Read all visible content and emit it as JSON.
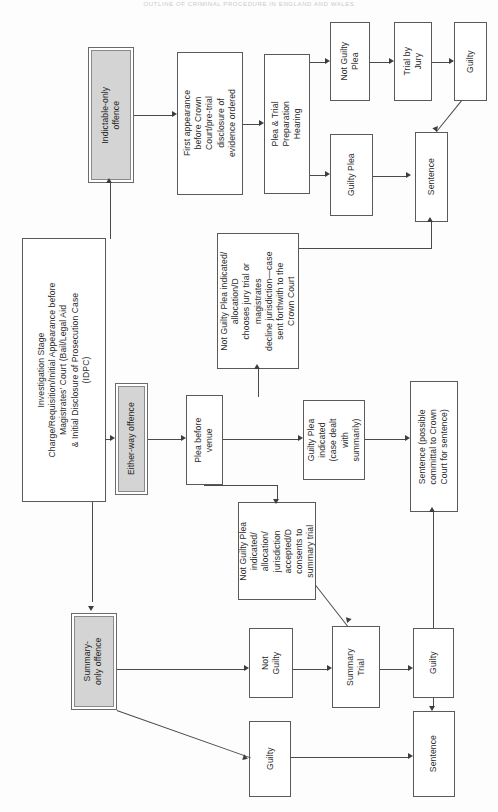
{
  "header": {
    "running_title": "OUTLINE OF CRIMINAL PROCEDURE IN ENGLAND AND WALES"
  },
  "nodes": {
    "investigation": "Investigation Stage\nCharge/Requisition/Initial Appearance before\nMagistrates' Court (Bail/Legal Aid\n& Initial Disclosure of Prosecution Case\n(IDPC)",
    "indictable_only": "Indictable-only\noffence",
    "first_appearance": "First appearance\nbefore Crown\nCourt/pre-trial\ndisclosure of\nevidence ordered",
    "ptph": "Plea & Trial\nPreparation\nHearing",
    "not_guilty_plea": "Not Guilty\nPlea",
    "trial_by_jury": "Trial by\nJury",
    "guilty_crown": "Guilty",
    "guilty_plea_crown": "Guilty Plea",
    "sentence_crown": "Sentence",
    "either_way": "Either-way offence",
    "plea_before_venue": "Plea before\nvenue",
    "ng_allocation_crown": "Not Guilty Plea indicated/\nallocation/D\nchooses jury trial or\nmagistrates\ndecline jurisdiction—case\nsent forthwith to the\nCrown Court",
    "guilty_plea_summary": "Guilty Plea\nindicated\n(case dealt\nwith\nsummarily)",
    "sentence_committal": "Sentence (possible\ncommittal to Crown\nCourt for sentence)",
    "ng_allocation_summary": "Not Guilty Plea\nindicated/\nallocation/\njurisdiction\naccepted/D\nconsents to\nsummary trial",
    "summary_only": "Summary-\nonly offence",
    "not_guilty_mags": "Not\nGuilty",
    "summary_trial": "Summary\nTrial",
    "guilty_mags": "Guilty",
    "guilty_plea_mags": "Guilty",
    "sentence_mags": "Sentence"
  },
  "colors": {
    "category_fill": "#d4d4d4",
    "node_border": "#5a5a5a",
    "connector": "#4a4a4a",
    "page_background": "#fdfdfd",
    "text": "#2b2b2b"
  },
  "watermark": {
    "line1": "",
    "line2": ""
  }
}
